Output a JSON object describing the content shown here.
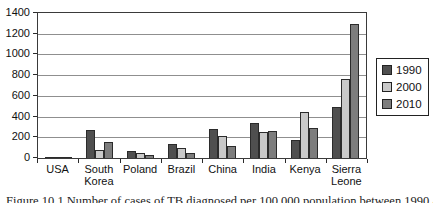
{
  "chart_data": {
    "type": "bar",
    "title": "",
    "xlabel": "",
    "ylabel": "",
    "categories": [
      "USA",
      "South Korea",
      "Poland",
      "Brazil",
      "China",
      "India",
      "Kenya",
      "Sierra Leone"
    ],
    "series": [
      {
        "name": "1990",
        "color": "#4f4f4f",
        "values": [
          10,
          270,
          70,
          140,
          280,
          340,
          170,
          490
        ]
      },
      {
        "name": "2000",
        "color": "#c9c9c9",
        "values": [
          6,
          75,
          45,
          95,
          215,
          250,
          440,
          760
        ]
      },
      {
        "name": "2010",
        "color": "#7d7d7d",
        "values": [
          4,
          150,
          30,
          50,
          115,
          260,
          290,
          1290
        ]
      }
    ],
    "ylim": [
      0,
      1400
    ],
    "yticks": [
      0,
      200,
      400,
      600,
      800,
      1000,
      1200,
      1400
    ],
    "grid": "horizontal",
    "legend_position": "right",
    "legend_labels": [
      "1990",
      "2000",
      "2010"
    ]
  },
  "caption": "Figure 10.1 Number of cases of TB diagnosed per 100,000 population between 1990 and 2010",
  "colors": {
    "axis": "#2b2b2b",
    "gridline": "#8f8f8f",
    "background": "#ffffff",
    "text": "#111111"
  }
}
